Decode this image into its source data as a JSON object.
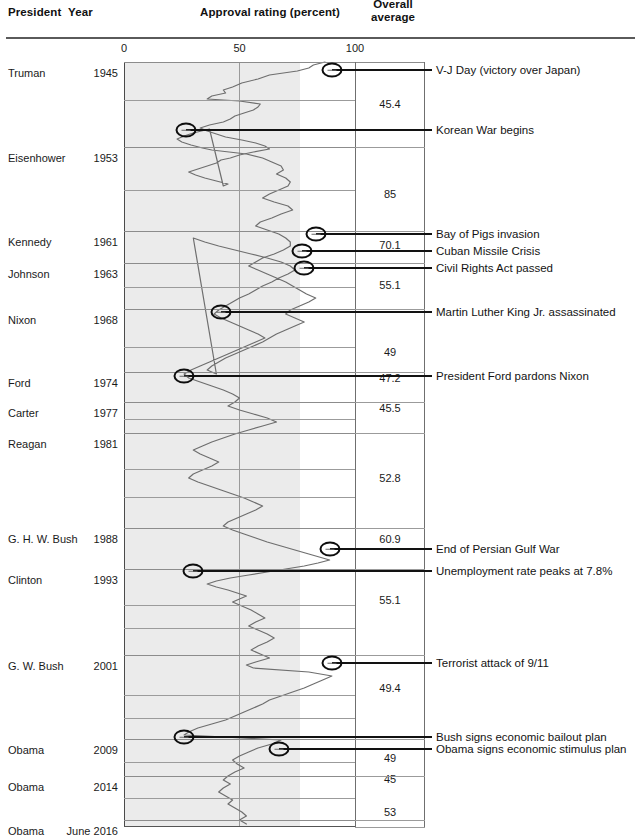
{
  "header": {
    "president": "President",
    "year": "Year",
    "approval": "Approval rating (percent)",
    "overall_line1": "Overall",
    "overall_line2": "average"
  },
  "axis": {
    "ticks": [
      {
        "label": "0",
        "value": 0
      },
      {
        "label": "50",
        "value": 50
      },
      {
        "label": "100",
        "value": 100
      }
    ]
  },
  "rows": [
    {
      "president": "Truman",
      "year": "1945",
      "average": "45.4"
    },
    {
      "president": "Eisenhower",
      "year": "1953",
      "average": "85"
    },
    {
      "president": "Kennedy",
      "year": "1961",
      "average": "70.1"
    },
    {
      "president": "Johnson",
      "year": "1963",
      "average": "55.1"
    },
    {
      "president": "Nixon",
      "year": "1968",
      "average": "49"
    },
    {
      "president": "Ford",
      "year": "1974",
      "average": "47.2"
    },
    {
      "president": "Carter",
      "year": "1977",
      "average": "45.5"
    },
    {
      "president": "Reagan",
      "year": "1981",
      "average": "52.8"
    },
    {
      "president": "G. H. W. Bush",
      "year": "1988",
      "average": "60.9"
    },
    {
      "president": "Clinton",
      "year": "1993",
      "average": "55.1"
    },
    {
      "president": "G. W. Bush",
      "year": "2001",
      "average": "49.4"
    },
    {
      "president": "Obama",
      "year": "2009",
      "average": "49"
    },
    {
      "president": "Obama",
      "year": "2014",
      "average": "45"
    },
    {
      "president": "Obama",
      "year": "June 2016",
      "average": "53"
    }
  ],
  "events": [
    {
      "label": "V-J Day (victory over Japan)",
      "approval": 90
    },
    {
      "label": "Korean War begins",
      "approval": 27
    },
    {
      "label": "Bay of Pigs invasion",
      "approval": 83
    },
    {
      "label": "Cuban Missile Crisis",
      "approval": 77
    },
    {
      "label": "Civil Rights Act passed",
      "approval": 78
    },
    {
      "label": "Martin Luther King Jr. assassinated",
      "approval": 42
    },
    {
      "label": "President Ford pardons Nixon",
      "approval": 26
    },
    {
      "label": "End of Persian Gulf War",
      "approval": 89
    },
    {
      "label": "Unemployment rate peaks at 7.8%",
      "approval": 30
    },
    {
      "label": "Terrorist attack of 9/11",
      "approval": 90
    },
    {
      "label": "Bush signs economic bailout plan",
      "approval": 26
    },
    {
      "label": "Obama signs economic stimulus plan",
      "approval": 67
    }
  ],
  "chart_data": {
    "type": "line",
    "title": "Approval rating (percent)",
    "orientation": "vertical-time",
    "xlabel": "Approval rating (percent)",
    "ylabel": "Year",
    "xlim": [
      0,
      100
    ],
    "ylim": [
      "1945",
      "June 2016"
    ],
    "grid": true,
    "legend": "none",
    "shaded_band": [
      0,
      76
    ],
    "categories": [
      "Truman",
      "Eisenhower",
      "Kennedy",
      "Johnson",
      "Nixon",
      "Ford",
      "Carter",
      "Reagan",
      "G. H. W. Bush",
      "Clinton",
      "G. W. Bush",
      "Obama",
      "Obama",
      "Obama"
    ],
    "series": [
      {
        "name": "Overall average",
        "values": [
          45.4,
          85,
          70.1,
          55.1,
          49,
          47.2,
          45.5,
          52.8,
          60.9,
          55.1,
          49.4,
          49,
          45,
          53
        ]
      }
    ],
    "annotations": [
      {
        "text": "V-J Day (victory over Japan)",
        "year": 1945,
        "approval": 90
      },
      {
        "text": "Korean War begins",
        "year": 1950,
        "approval": 27
      },
      {
        "text": "Bay of Pigs invasion",
        "year": 1961,
        "approval": 83
      },
      {
        "text": "Cuban Missile Crisis",
        "year": 1962,
        "approval": 77
      },
      {
        "text": "Civil Rights Act passed",
        "year": 1964,
        "approval": 78
      },
      {
        "text": "Martin Luther King Jr. assassinated",
        "year": 1968,
        "approval": 42
      },
      {
        "text": "President Ford pardons Nixon",
        "year": 1974,
        "approval": 26
      },
      {
        "text": "End of Persian Gulf War",
        "year": 1991,
        "approval": 89
      },
      {
        "text": "Unemployment rate peaks at 7.8%",
        "year": 1992,
        "approval": 30
      },
      {
        "text": "Terrorist attack of 9/11",
        "year": 2001,
        "approval": 90
      },
      {
        "text": "Bush signs economic bailout plan",
        "year": 2008,
        "approval": 26
      },
      {
        "text": "Obama signs economic stimulus plan",
        "year": 2009,
        "approval": 67
      }
    ],
    "approval_trace": [
      [
        87,
        62
      ],
      [
        82,
        65
      ],
      [
        80,
        68
      ],
      [
        75,
        71
      ],
      [
        63,
        75
      ],
      [
        58,
        79
      ],
      [
        51,
        83
      ],
      [
        47,
        87
      ],
      [
        43,
        90
      ],
      [
        44,
        93
      ],
      [
        38,
        96
      ],
      [
        36,
        99
      ],
      [
        50,
        101
      ],
      [
        59,
        104
      ],
      [
        58,
        107
      ],
      [
        56,
        110
      ],
      [
        52,
        113
      ],
      [
        48,
        116
      ],
      [
        46,
        119
      ],
      [
        43,
        122
      ],
      [
        37,
        125
      ],
      [
        33,
        128
      ],
      [
        36,
        131
      ],
      [
        40,
        134
      ],
      [
        44,
        137
      ],
      [
        51,
        140
      ],
      [
        57,
        143
      ],
      [
        61,
        146
      ],
      [
        63,
        149
      ],
      [
        56,
        152
      ],
      [
        50,
        155
      ],
      [
        46,
        158
      ],
      [
        42,
        160
      ],
      [
        40,
        163
      ],
      [
        36,
        166
      ],
      [
        32,
        169
      ],
      [
        28,
        172
      ],
      [
        31,
        175
      ],
      [
        35,
        178
      ],
      [
        40,
        181
      ],
      [
        45,
        184
      ],
      [
        43,
        186
      ],
      [
        37,
        129
      ],
      [
        30,
        133
      ],
      [
        26,
        136
      ],
      [
        23,
        139
      ],
      [
        25,
        142
      ],
      [
        29,
        145
      ],
      [
        34,
        148
      ],
      [
        38,
        150
      ],
      [
        53,
        154
      ],
      [
        60,
        158
      ],
      [
        64,
        162
      ],
      [
        68,
        166
      ],
      [
        69,
        170
      ],
      [
        66,
        174
      ],
      [
        70,
        178
      ],
      [
        72,
        182
      ],
      [
        71,
        186
      ],
      [
        67,
        190
      ],
      [
        63,
        194
      ],
      [
        60,
        198
      ],
      [
        65,
        202
      ],
      [
        71,
        206
      ],
      [
        73,
        210
      ],
      [
        68,
        214
      ],
      [
        64,
        218
      ],
      [
        59,
        222
      ],
      [
        57,
        226
      ],
      [
        62,
        230
      ],
      [
        67,
        234
      ],
      [
        70,
        238
      ],
      [
        72,
        242
      ],
      [
        72,
        246
      ],
      [
        69,
        250
      ],
      [
        65,
        254
      ],
      [
        60,
        258
      ],
      [
        57,
        262
      ],
      [
        54,
        266
      ],
      [
        58,
        270
      ],
      [
        62,
        274
      ],
      [
        66,
        278
      ],
      [
        70,
        282
      ],
      [
        73,
        286
      ],
      [
        76,
        290
      ],
      [
        79,
        294
      ],
      [
        83,
        298
      ],
      [
        80,
        302
      ],
      [
        76,
        306
      ],
      [
        72,
        310
      ],
      [
        70,
        314
      ],
      [
        74,
        318
      ],
      [
        78,
        322
      ],
      [
        74,
        326
      ],
      [
        70,
        330
      ],
      [
        66,
        334
      ],
      [
        63,
        338
      ],
      [
        60,
        342
      ],
      [
        56,
        346
      ],
      [
        52,
        350
      ],
      [
        48,
        354
      ],
      [
        44,
        358
      ],
      [
        41,
        362
      ],
      [
        38,
        366
      ],
      [
        36,
        370
      ],
      [
        40,
        374
      ],
      [
        30,
        238
      ],
      [
        35,
        242
      ],
      [
        41,
        246
      ],
      [
        48,
        250
      ],
      [
        55,
        254
      ],
      [
        62,
        258
      ],
      [
        68,
        262
      ],
      [
        72,
        266
      ],
      [
        74,
        270
      ],
      [
        71,
        274
      ],
      [
        67,
        278
      ],
      [
        64,
        282
      ],
      [
        60,
        286
      ],
      [
        57,
        290
      ],
      [
        54,
        294
      ],
      [
        50,
        298
      ],
      [
        47,
        302
      ],
      [
        44,
        306
      ],
      [
        41,
        310
      ],
      [
        39,
        314
      ],
      [
        42,
        318
      ],
      [
        46,
        322
      ],
      [
        50,
        326
      ],
      [
        54,
        330
      ],
      [
        58,
        334
      ],
      [
        61,
        338
      ],
      [
        57,
        342
      ],
      [
        53,
        346
      ],
      [
        49,
        350
      ],
      [
        45,
        354
      ],
      [
        41,
        358
      ],
      [
        37,
        362
      ],
      [
        33,
        366
      ],
      [
        29,
        370
      ],
      [
        26,
        374
      ],
      [
        28,
        378
      ],
      [
        33,
        382
      ],
      [
        38,
        386
      ],
      [
        43,
        390
      ],
      [
        47,
        394
      ],
      [
        50,
        398
      ],
      [
        48,
        402
      ],
      [
        45,
        406
      ],
      [
        50,
        410
      ],
      [
        56,
        414
      ],
      [
        62,
        418
      ],
      [
        66,
        422
      ],
      [
        60,
        426
      ],
      [
        54,
        430
      ],
      [
        48,
        434
      ],
      [
        43,
        438
      ],
      [
        38,
        442
      ],
      [
        34,
        446
      ],
      [
        30,
        450
      ],
      [
        33,
        454
      ],
      [
        37,
        458
      ],
      [
        41,
        462
      ],
      [
        38,
        466
      ],
      [
        34,
        470
      ],
      [
        30,
        474
      ],
      [
        28,
        478
      ],
      [
        32,
        482
      ],
      [
        37,
        486
      ],
      [
        42,
        490
      ],
      [
        47,
        494
      ],
      [
        52,
        498
      ],
      [
        56,
        502
      ],
      [
        60,
        506
      ],
      [
        57,
        510
      ],
      [
        53,
        514
      ],
      [
        49,
        518
      ],
      [
        45,
        522
      ],
      [
        43,
        526
      ],
      [
        47,
        530
      ],
      [
        52,
        534
      ],
      [
        57,
        538
      ],
      [
        62,
        542
      ],
      [
        68,
        546
      ],
      [
        74,
        550
      ],
      [
        80,
        554
      ],
      [
        86,
        558
      ],
      [
        89,
        560
      ],
      [
        84,
        563
      ],
      [
        78,
        566
      ],
      [
        70,
        569
      ],
      [
        62,
        572
      ],
      [
        54,
        575
      ],
      [
        46,
        578
      ],
      [
        40,
        581
      ],
      [
        36,
        584
      ],
      [
        40,
        587
      ],
      [
        45,
        590
      ],
      [
        49,
        593
      ],
      [
        53,
        596
      ],
      [
        50,
        599
      ],
      [
        47,
        602
      ],
      [
        51,
        606
      ],
      [
        55,
        610
      ],
      [
        58,
        614
      ],
      [
        61,
        618
      ],
      [
        57,
        622
      ],
      [
        54,
        626
      ],
      [
        58,
        630
      ],
      [
        62,
        634
      ],
      [
        65,
        638
      ],
      [
        62,
        642
      ],
      [
        58,
        646
      ],
      [
        55,
        650
      ],
      [
        59,
        654
      ],
      [
        63,
        658
      ],
      [
        57,
        662
      ],
      [
        53,
        665
      ],
      [
        56,
        668
      ],
      [
        80,
        672
      ],
      [
        90,
        676
      ],
      [
        86,
        680
      ],
      [
        82,
        684
      ],
      [
        78,
        688
      ],
      [
        73,
        692
      ],
      [
        68,
        696
      ],
      [
        63,
        700
      ],
      [
        60,
        704
      ],
      [
        56,
        708
      ],
      [
        52,
        712
      ],
      [
        48,
        716
      ],
      [
        44,
        720
      ],
      [
        38,
        724
      ],
      [
        32,
        728
      ],
      [
        28,
        732
      ],
      [
        26,
        735
      ],
      [
        68,
        740
      ],
      [
        64,
        744
      ],
      [
        58,
        748
      ],
      [
        54,
        752
      ],
      [
        50,
        756
      ],
      [
        47,
        760
      ],
      [
        49,
        764
      ],
      [
        52,
        768
      ],
      [
        48,
        772
      ],
      [
        45,
        776
      ],
      [
        43,
        780
      ],
      [
        46,
        784
      ],
      [
        43,
        788
      ],
      [
        41,
        792
      ],
      [
        44,
        796
      ],
      [
        47,
        800
      ],
      [
        45,
        804
      ],
      [
        48,
        808
      ],
      [
        51,
        812
      ],
      [
        53,
        816
      ],
      [
        50,
        820
      ],
      [
        53,
        824
      ]
    ]
  }
}
